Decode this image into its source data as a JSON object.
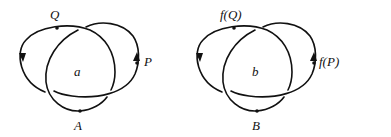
{
  "diagrams": [
    {
      "id": "a",
      "region_label": "a",
      "top_point": "Q",
      "right_point": "P",
      "bottom_point": "A"
    },
    {
      "id": "b",
      "region_label": "b",
      "top_point": "f(Q)",
      "right_point": "f(P)",
      "bottom_point": "B"
    }
  ]
}
